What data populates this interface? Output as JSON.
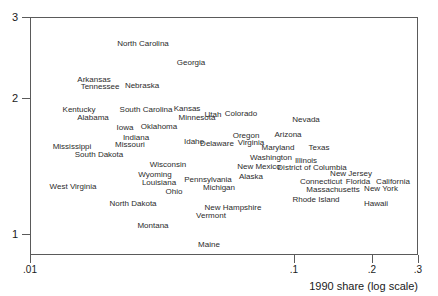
{
  "chart_data": {
    "type": "scatter",
    "title": "",
    "xlabel": "1990 share (log scale)",
    "ylabel": "",
    "xscale": "log",
    "grid": false,
    "legend": null,
    "xticks": [
      {
        "label": ".01",
        "value": 0.01,
        "px": 30
      },
      {
        "label": ".1",
        "value": 0.1,
        "px": 294
      },
      {
        "label": ".2",
        "value": 0.2,
        "px": 372
      },
      {
        "label": ".3",
        "value": 0.3,
        "px": 418
      }
    ],
    "yticks": [
      {
        "label": "1",
        "value": 1,
        "px": 234
      },
      {
        "label": "2",
        "value": 2,
        "px": 98
      },
      {
        "label": "3",
        "value": 3,
        "px": 17
      }
    ],
    "xlim": [
      0.0095,
      0.33
    ],
    "ylim": [
      0.88,
      3.05
    ],
    "marker_style": "text-label",
    "points": [
      {
        "label": "North Carolina",
        "x": 0.0425,
        "y": 2.7,
        "px": 142,
        "py": 42
      },
      {
        "label": "Georgia",
        "x": 0.0685,
        "y": 2.46,
        "px": 190,
        "py": 61
      },
      {
        "label": "Arkansas",
        "x": 0.0216,
        "y": 2.15,
        "px": 93,
        "py": 78
      },
      {
        "label": "Tennessee",
        "x": 0.024,
        "y": 2.1,
        "px": 99,
        "py": 85
      },
      {
        "label": "Nebraska",
        "x": 0.042,
        "y": 2.11,
        "px": 141,
        "py": 84
      },
      {
        "label": "Kentucky",
        "x": 0.0167,
        "y": 1.89,
        "px": 78,
        "py": 108
      },
      {
        "label": "South Carolina",
        "x": 0.044,
        "y": 1.89,
        "px": 145,
        "py": 108
      },
      {
        "label": "Kansas",
        "x": 0.066,
        "y": 1.9,
        "px": 186,
        "py": 107
      },
      {
        "label": "Utah",
        "x": 0.084,
        "y": 1.86,
        "px": 212,
        "py": 113
      },
      {
        "label": "Colorado",
        "x": 0.101,
        "y": 1.86,
        "px": 240,
        "py": 112
      },
      {
        "label": "Nevada",
        "x": 0.156,
        "y": 1.82,
        "px": 305,
        "py": 118
      },
      {
        "label": "Alabama",
        "x": 0.0205,
        "y": 1.83,
        "px": 92,
        "py": 116
      },
      {
        "label": "Minnesota",
        "x": 0.072,
        "y": 1.83,
        "px": 196,
        "py": 116
      },
      {
        "label": "Iowa",
        "x": 0.032,
        "y": 1.76,
        "px": 124,
        "py": 126
      },
      {
        "label": "Oklahoma",
        "x": 0.049,
        "y": 1.76,
        "px": 158,
        "py": 125
      },
      {
        "label": "Oregon",
        "x": 0.106,
        "y": 1.72,
        "px": 245,
        "py": 134
      },
      {
        "label": "Arizona",
        "x": 0.133,
        "y": 1.72,
        "px": 287,
        "py": 133
      },
      {
        "label": "Indiana",
        "x": 0.0365,
        "y": 1.69,
        "px": 135,
        "py": 136
      },
      {
        "label": "Idaho",
        "x": 0.0695,
        "y": 1.66,
        "px": 193,
        "py": 140
      },
      {
        "label": "Missouri",
        "x": 0.034,
        "y": 1.65,
        "px": 129,
        "py": 143
      },
      {
        "label": "Delaware",
        "x": 0.086,
        "y": 1.65,
        "px": 216,
        "py": 142
      },
      {
        "label": "Virginia",
        "x": 0.1125,
        "y": 1.66,
        "px": 250,
        "py": 141
      },
      {
        "label": "Mississippi",
        "x": 0.0145,
        "y": 1.63,
        "px": 71,
        "py": 145
      },
      {
        "label": "Maryland",
        "x": 0.123,
        "y": 1.62,
        "px": 277,
        "py": 146
      },
      {
        "label": "Texas",
        "x": 0.164,
        "y": 1.62,
        "px": 318,
        "py": 146
      },
      {
        "label": "South Dakota",
        "x": 0.0225,
        "y": 1.58,
        "px": 98,
        "py": 153
      },
      {
        "label": "Washington",
        "x": 0.1175,
        "y": 1.56,
        "px": 270,
        "py": 156
      },
      {
        "label": "Illinois",
        "x": 0.156,
        "y": 1.54,
        "px": 305,
        "py": 159
      },
      {
        "label": "Wisconsin",
        "x": 0.0545,
        "y": 1.52,
        "px": 167,
        "py": 163
      },
      {
        "label": "New Mexico",
        "x": 0.104,
        "y": 1.5,
        "px": 258,
        "py": 165
      },
      {
        "label": "District of Columbia",
        "x": 0.16,
        "y": 1.5,
        "px": 311,
        "py": 166
      },
      {
        "label": "Wyoming",
        "x": 0.0435,
        "y": 1.46,
        "px": 154,
        "py": 173
      },
      {
        "label": "New Jersey",
        "x": 0.204,
        "y": 1.44,
        "px": 350,
        "py": 172
      },
      {
        "label": "Alaska",
        "x": 0.098,
        "y": 1.42,
        "px": 250,
        "py": 175
      },
      {
        "label": "Pennsylvania",
        "x": 0.0745,
        "y": 1.41,
        "px": 207,
        "py": 178
      },
      {
        "label": "Louisiana",
        "x": 0.046,
        "y": 1.41,
        "px": 158,
        "py": 181
      },
      {
        "label": "Connecticut",
        "x": 0.176,
        "y": 1.39,
        "px": 320,
        "py": 180
      },
      {
        "label": "Florida",
        "x": 0.2155,
        "y": 1.39,
        "px": 357,
        "py": 180
      },
      {
        "label": "California",
        "x": 0.272,
        "y": 1.39,
        "px": 392,
        "py": 180
      },
      {
        "label": "West Virginia",
        "x": 0.0148,
        "y": 1.38,
        "px": 72,
        "py": 185
      },
      {
        "label": "Michigan",
        "x": 0.08,
        "y": 1.37,
        "px": 218,
        "py": 186
      },
      {
        "label": "New York",
        "x": 0.248,
        "y": 1.37,
        "px": 380,
        "py": 187
      },
      {
        "label": "Massachusetts",
        "x": 0.188,
        "y": 1.35,
        "px": 332,
        "py": 188
      },
      {
        "label": "Ohio",
        "x": 0.057,
        "y": 1.34,
        "px": 173,
        "py": 190
      },
      {
        "label": "Rhode Island",
        "x": 0.17,
        "y": 1.3,
        "px": 315,
        "py": 198
      },
      {
        "label": "Hawaii",
        "x": 0.238,
        "y": 1.28,
        "px": 375,
        "py": 202
      },
      {
        "label": "North Dakota",
        "x": 0.0355,
        "y": 1.28,
        "px": 132,
        "py": 202
      },
      {
        "label": "New Hampshire",
        "x": 0.091,
        "y": 1.25,
        "px": 232,
        "py": 206
      },
      {
        "label": "Vermont",
        "x": 0.0755,
        "y": 1.21,
        "px": 210,
        "py": 214
      },
      {
        "label": "Montana",
        "x": 0.045,
        "y": 1.15,
        "px": 152,
        "py": 224
      },
      {
        "label": "Maine",
        "x": 0.0745,
        "y": 0.96,
        "px": 208,
        "py": 243
      }
    ]
  }
}
